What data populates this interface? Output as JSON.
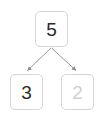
{
  "diagram": {
    "type": "number-bond-tree",
    "background_color": "#ffffff",
    "node_border_color": "#d6d6d6",
    "edge_color": "#999999",
    "filled_text_color": "#2b2b2b",
    "dimmed_text_color": "#cfcfcf",
    "nodes": {
      "root": {
        "value": "5",
        "state": "filled"
      },
      "left_child": {
        "value": "3",
        "state": "filled"
      },
      "right_child": {
        "value": "2",
        "state": "dimmed"
      }
    },
    "edges": [
      {
        "name": "root-to-left",
        "from": "root",
        "to": "left_child",
        "arrowhead": "true"
      },
      {
        "name": "root-to-right",
        "from": "root",
        "to": "right_child",
        "arrowhead": "true"
      }
    ]
  }
}
